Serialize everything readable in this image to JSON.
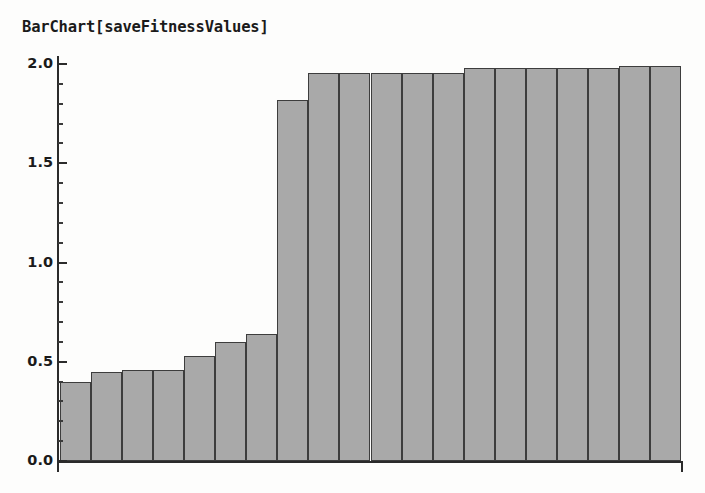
{
  "chart_data": {
    "type": "bar",
    "title": "BarChart[saveFitnessValues]",
    "xlabel": "",
    "ylabel": "",
    "ylim": [
      0.0,
      2.0
    ],
    "xlim": [
      0,
      20
    ],
    "grid": false,
    "legend": null,
    "legend_position": "none",
    "y_ticks_major": [
      0.0,
      0.5,
      1.0,
      1.5,
      2.0
    ],
    "y_tick_labels": [
      "0.0",
      "0.5",
      "1.0",
      "1.5",
      "2.0"
    ],
    "y_tick_minor_step": 0.1,
    "x_tick_labels": [],
    "bar_fill_color": "#a9a9a9",
    "bar_edge_color": "#3d3d3d",
    "axis_color": "#2b2b2b",
    "background_color": "#fdfdfc",
    "categories": [
      1,
      2,
      3,
      4,
      5,
      6,
      7,
      8,
      9,
      10,
      11,
      12,
      13,
      14,
      15,
      16,
      17,
      18,
      19,
      20
    ],
    "values": [
      0.4,
      0.45,
      0.46,
      0.46,
      0.53,
      0.6,
      0.64,
      1.82,
      1.955,
      1.955,
      1.955,
      1.955,
      1.955,
      1.98,
      1.98,
      1.98,
      1.98,
      1.98,
      1.99,
      1.99
    ]
  },
  "axis_labels": {
    "y": [
      {
        "text": "2.0",
        "value": 2.0
      },
      {
        "text": "1.5",
        "value": 1.5
      },
      {
        "text": "1.0",
        "value": 1.0
      },
      {
        "text": "0.5",
        "value": 0.5
      },
      {
        "text": "0.0",
        "value": 0.0
      }
    ]
  }
}
